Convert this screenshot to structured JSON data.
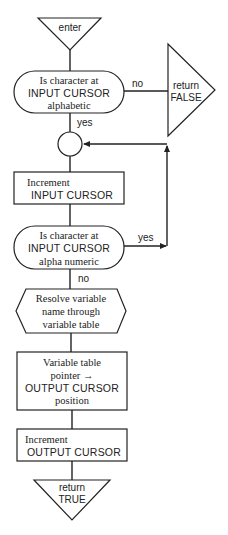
{
  "diagram": {
    "type": "flowchart",
    "nodes": {
      "enter": {
        "shape": "terminal-triangle-down",
        "label": "enter"
      },
      "check_alpha": {
        "shape": "decision-stadium",
        "lines": [
          "Is character at",
          "INPUT CURSOR",
          "alphabetic"
        ]
      },
      "return_false": {
        "shape": "terminal-triangle-right",
        "lines": [
          "return",
          "FALSE"
        ]
      },
      "connector": {
        "shape": "circle-connector"
      },
      "increment_input": {
        "shape": "process-box",
        "lines": [
          "Increment",
          "INPUT CURSOR"
        ]
      },
      "check_alnum": {
        "shape": "decision-stadium",
        "lines": [
          "Is character at",
          "INPUT CURSOR",
          "alpha numeric"
        ]
      },
      "resolve_variable": {
        "shape": "hexagon",
        "lines": [
          "Resolve variable",
          "name through",
          "variable table"
        ]
      },
      "pointer_to_output": {
        "shape": "process-box",
        "lines": [
          "Variable table",
          "pointer →",
          "OUTPUT CURSOR",
          "position"
        ]
      },
      "increment_output": {
        "shape": "process-box",
        "lines": [
          "Increment",
          "OUTPUT CURSOR"
        ]
      },
      "return_true": {
        "shape": "terminal-triangle-down",
        "lines": [
          "return",
          "TRUE"
        ]
      }
    },
    "edges": {
      "alpha_no": "no",
      "alpha_yes": "yes",
      "alnum_yes": "yes",
      "alnum_no": "no"
    }
  }
}
